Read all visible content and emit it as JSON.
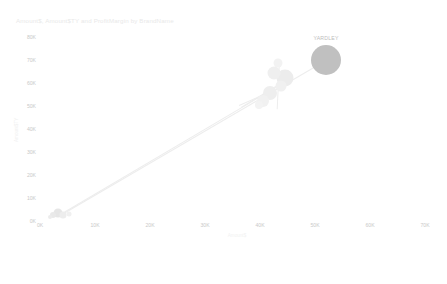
{
  "chart_data": {
    "type": "scatter",
    "title": "Amount$, Amount$TY and ProfitMargin by BrandName",
    "xlabel": "Amount$",
    "ylabel": "Amount$TY",
    "size_field": "ProfitMargin",
    "xlim": [
      0,
      70000
    ],
    "ylim": [
      0,
      80000
    ],
    "grid": false,
    "legend": "none",
    "x_ticks": [
      "0K",
      "10K",
      "20K",
      "30K",
      "40K",
      "50K",
      "60K",
      "70K"
    ],
    "x_tick_values": [
      0,
      10000,
      20000,
      30000,
      40000,
      50000,
      60000,
      70000
    ],
    "y_ticks": [
      "80K",
      "70K",
      "60K",
      "50K",
      "40K",
      "30K",
      "20K",
      "10K",
      "0K"
    ],
    "y_tick_values": [
      80000,
      70000,
      60000,
      50000,
      40000,
      30000,
      20000,
      10000,
      0
    ],
    "points": [
      {
        "label": "YARDLEY",
        "x": 52000,
        "y": 70000,
        "size": 30,
        "color": "#c0c0c0",
        "opacity": 1
      },
      {
        "label": "",
        "x": 44500,
        "y": 62000,
        "size": 17,
        "color": "#ececec",
        "opacity": 1
      },
      {
        "label": "",
        "x": 43800,
        "y": 58500,
        "size": 11,
        "color": "#f0f0f0",
        "opacity": 1
      },
      {
        "label": "",
        "x": 43200,
        "y": 68500,
        "size": 9,
        "color": "#f2f2f2",
        "opacity": 1
      },
      {
        "label": "",
        "x": 42600,
        "y": 64500,
        "size": 13,
        "color": "#efefef",
        "opacity": 1
      },
      {
        "label": "",
        "x": 41800,
        "y": 55500,
        "size": 14,
        "color": "#eeeeee",
        "opacity": 1
      },
      {
        "label": "",
        "x": 40600,
        "y": 52000,
        "size": 12,
        "color": "#f1f1f1",
        "opacity": 1
      },
      {
        "label": "",
        "x": 39800,
        "y": 50500,
        "size": 8,
        "color": "#f3f3f3",
        "opacity": 1
      },
      {
        "label": "",
        "x": 3200,
        "y": 3400,
        "size": 9,
        "color": "#e6e6e6",
        "opacity": 1
      },
      {
        "label": "",
        "x": 4200,
        "y": 2600,
        "size": 7,
        "color": "#ededed",
        "opacity": 1
      },
      {
        "label": "",
        "x": 2400,
        "y": 2400,
        "size": 6,
        "color": "#e9e9e9",
        "opacity": 1
      },
      {
        "label": "",
        "x": 5200,
        "y": 3000,
        "size": 5,
        "color": "#f0f0f0",
        "opacity": 1
      },
      {
        "label": "",
        "x": 1800,
        "y": 1600,
        "size": 4,
        "color": "#ececec",
        "opacity": 1
      }
    ],
    "trails": [
      {
        "x1": 4000,
        "y1": 3000,
        "x2": 52000,
        "y2": 70000
      },
      {
        "x1": 3000,
        "y1": 2200,
        "x2": 44000,
        "y2": 60000
      },
      {
        "x1": 36500,
        "y1": 49500,
        "x2": 45500,
        "y2": 62500
      },
      {
        "x1": 36200,
        "y1": 50500,
        "x2": 44800,
        "y2": 59500
      },
      {
        "x1": 43000,
        "y1": 48500,
        "x2": 43400,
        "y2": 69000
      }
    ]
  },
  "timeline": {
    "label": "Show Date",
    "play_icon": "play-icon",
    "handle_position_pct": 31,
    "ticks_pct": [
      0,
      31,
      62,
      93
    ],
    "dates": [
      {
        "label": "Apr 2011",
        "position_pct": 2
      },
      {
        "label": "May 2011",
        "position_pct": 31
      },
      {
        "label": "Jun 2011",
        "position_pct": 62
      },
      {
        "label": "Jul 2011",
        "position_pct": 93
      }
    ]
  }
}
